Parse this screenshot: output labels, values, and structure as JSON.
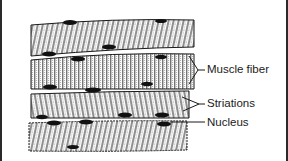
{
  "diagram": {
    "type": "labeled-illustration",
    "labels": [
      {
        "id": "muscle-fiber",
        "text": "Muscle fiber"
      },
      {
        "id": "striations",
        "text": "Striations"
      },
      {
        "id": "nucleus",
        "text": "Nucleus"
      }
    ],
    "fiber_count": 4,
    "colors": {
      "ink": "#1a1a1a",
      "background": "#ffffff",
      "border": "#2a2a2a"
    }
  }
}
